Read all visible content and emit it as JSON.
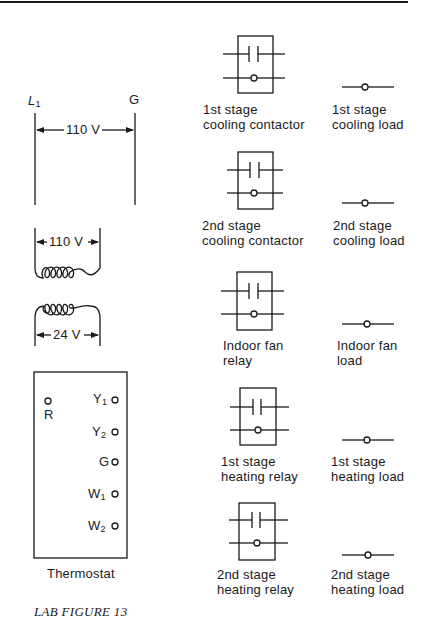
{
  "figure": {
    "caption": "LAB FIGURE 13",
    "supply": {
      "left_terminal": "L",
      "left_terminal_sub": "1",
      "right_terminal": "G",
      "voltage": "110 V"
    },
    "transformer": {
      "primary_voltage": "110 V",
      "secondary_voltage": "24 V"
    },
    "thermostat": {
      "label": "Thermostat",
      "terminal_r": "R",
      "terminals": [
        {
          "letter": "Y",
          "sub": "1"
        },
        {
          "letter": "Y",
          "sub": "2"
        },
        {
          "letter": "G",
          "sub": ""
        },
        {
          "letter": "W",
          "sub": "1"
        },
        {
          "letter": "W",
          "sub": "2"
        }
      ]
    },
    "relays": [
      {
        "line1": "1st stage",
        "line2": "cooling contactor"
      },
      {
        "line1": "2nd stage",
        "line2": "cooling contactor"
      },
      {
        "line1": "Indoor fan",
        "line2": "relay"
      },
      {
        "line1": "1st stage",
        "line2": "heating relay"
      },
      {
        "line1": "2nd stage",
        "line2": "heating relay"
      }
    ],
    "loads": [
      {
        "line1": "1st stage",
        "line2": "cooling load"
      },
      {
        "line1": "2nd stage",
        "line2": "cooling load"
      },
      {
        "line1": "Indoor fan",
        "line2": "load"
      },
      {
        "line1": "1st stage",
        "line2": "heating load"
      },
      {
        "line1": "2nd stage",
        "line2": "heating load"
      }
    ],
    "colors": {
      "ink": "#1a1a1a",
      "background": "#ffffff"
    }
  }
}
